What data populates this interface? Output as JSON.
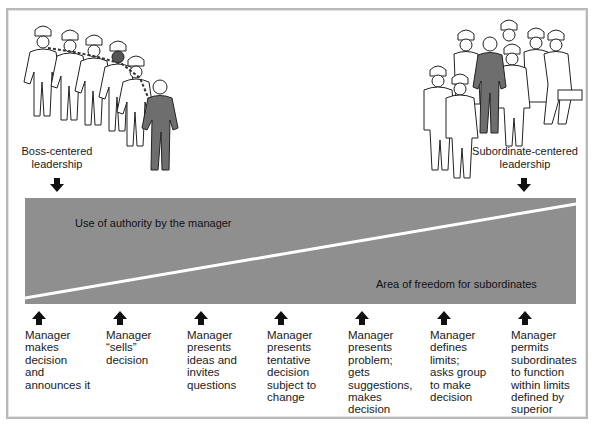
{
  "diagram": {
    "left_end": {
      "label_line1": "Boss-centered",
      "label_line2": "leadership",
      "illustration": "boss-leading-chained-workers-illustration"
    },
    "right_end": {
      "label_line1": "Subordinate-centered",
      "label_line2": "leadership",
      "illustration": "manager-walking-with-group-illustration"
    },
    "band": {
      "upper_region_label": "Use of authority by the manager",
      "lower_region_label": "Area of freedom for subordinates",
      "fill_color": "#8f8f8f",
      "divider_color": "#ffffff"
    },
    "steps": [
      {
        "lines": [
          "Manager",
          "makes",
          "decision",
          "and",
          "announces it"
        ]
      },
      {
        "lines": [
          "Manager",
          "“sells”",
          "decision"
        ]
      },
      {
        "lines": [
          "Manager",
          "presents",
          "ideas and",
          "invites",
          "questions"
        ]
      },
      {
        "lines": [
          "Manager",
          "presents",
          "tentative",
          "decision",
          "subject to",
          "change"
        ]
      },
      {
        "lines": [
          "Manager",
          "presents",
          "problem;",
          "gets",
          "suggestions,",
          "makes",
          "decision"
        ]
      },
      {
        "lines": [
          "Manager",
          "defines",
          "limits;",
          "asks group",
          "to make",
          "decision"
        ]
      },
      {
        "lines": [
          "Manager",
          "permits",
          "subordinates",
          "to function",
          "within limits",
          "defined by",
          "superior"
        ]
      }
    ],
    "icons": {
      "down_arrow": "down-arrow-icon",
      "up_arrow": "up-arrow-icon"
    }
  }
}
